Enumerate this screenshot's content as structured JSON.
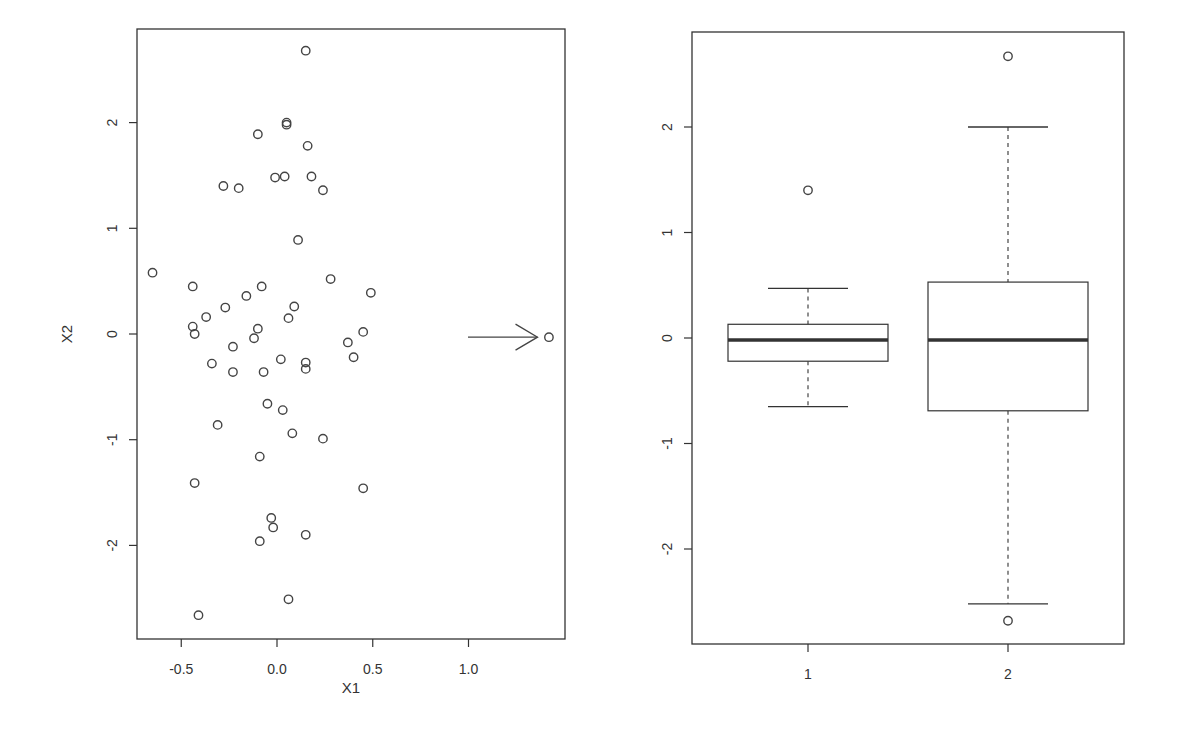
{
  "chart_data": [
    {
      "type": "scatter",
      "title": "",
      "xlabel": "X1",
      "ylabel": "X2",
      "xlim": [
        -0.72,
        1.51
      ],
      "ylim": [
        -2.87,
        2.92
      ],
      "xticks": [
        -0.5,
        0.0,
        0.5,
        1.0
      ],
      "xtick_labels": [
        "-0.5",
        "0.0",
        "0.5",
        "1.0"
      ],
      "yticks": [
        -2,
        -1,
        0,
        1,
        2
      ],
      "ytick_labels": [
        "-2",
        "-1",
        "0",
        "1",
        "2"
      ],
      "grid": false,
      "annotation": {
        "type": "arrow",
        "from": [
          1.0,
          -0.03
        ],
        "to": [
          1.35,
          -0.03
        ],
        "label": "points to outlier"
      },
      "points": [
        {
          "x": 0.15,
          "y": 2.68
        },
        {
          "x": 0.05,
          "y": 2.0
        },
        {
          "x": 0.05,
          "y": 1.98
        },
        {
          "x": -0.1,
          "y": 1.89
        },
        {
          "x": 0.16,
          "y": 1.78
        },
        {
          "x": -0.01,
          "y": 1.48
        },
        {
          "x": 0.04,
          "y": 1.49
        },
        {
          "x": 0.18,
          "y": 1.49
        },
        {
          "x": 0.24,
          "y": 1.36
        },
        {
          "x": -0.28,
          "y": 1.4
        },
        {
          "x": -0.2,
          "y": 1.38
        },
        {
          "x": 0.11,
          "y": 0.89
        },
        {
          "x": -0.65,
          "y": 0.58
        },
        {
          "x": -0.44,
          "y": 0.45
        },
        {
          "x": -0.16,
          "y": 0.36
        },
        {
          "x": -0.08,
          "y": 0.45
        },
        {
          "x": 0.28,
          "y": 0.52
        },
        {
          "x": 0.49,
          "y": 0.39
        },
        {
          "x": -0.37,
          "y": 0.16
        },
        {
          "x": -0.27,
          "y": 0.25
        },
        {
          "x": 0.09,
          "y": 0.26
        },
        {
          "x": 0.06,
          "y": 0.15
        },
        {
          "x": -0.44,
          "y": 0.07
        },
        {
          "x": -0.43,
          "y": 0.0
        },
        {
          "x": -0.1,
          "y": 0.05
        },
        {
          "x": -0.12,
          "y": -0.04
        },
        {
          "x": 0.37,
          "y": -0.08
        },
        {
          "x": 0.45,
          "y": 0.02
        },
        {
          "x": 0.4,
          "y": -0.22
        },
        {
          "x": -0.23,
          "y": -0.12
        },
        {
          "x": -0.34,
          "y": -0.28
        },
        {
          "x": -0.23,
          "y": -0.36
        },
        {
          "x": -0.07,
          "y": -0.36
        },
        {
          "x": 0.02,
          "y": -0.24
        },
        {
          "x": 0.15,
          "y": -0.27
        },
        {
          "x": 0.15,
          "y": -0.33
        },
        {
          "x": -0.05,
          "y": -0.66
        },
        {
          "x": 0.03,
          "y": -0.72
        },
        {
          "x": -0.31,
          "y": -0.86
        },
        {
          "x": 0.08,
          "y": -0.94
        },
        {
          "x": 0.24,
          "y": -0.99
        },
        {
          "x": -0.09,
          "y": -1.16
        },
        {
          "x": -0.43,
          "y": -1.41
        },
        {
          "x": 0.45,
          "y": -1.46
        },
        {
          "x": -0.03,
          "y": -1.74
        },
        {
          "x": -0.02,
          "y": -1.83
        },
        {
          "x": 0.15,
          "y": -1.9
        },
        {
          "x": -0.09,
          "y": -1.96
        },
        {
          "x": 0.06,
          "y": -2.51
        },
        {
          "x": -0.41,
          "y": -2.66
        },
        {
          "x": 1.42,
          "y": -0.03
        }
      ]
    },
    {
      "type": "box",
      "title": "",
      "xlabel": "",
      "ylabel": "",
      "categories": [
        "1",
        "2"
      ],
      "ylim": [
        -2.87,
        2.92
      ],
      "yticks": [
        -2,
        -1,
        0,
        1,
        2
      ],
      "ytick_labels": [
        "-2",
        "-1",
        "0",
        "1",
        "2"
      ],
      "grid": false,
      "boxes": [
        {
          "name": "1",
          "whisker_low": -0.65,
          "q1": -0.22,
          "median": -0.02,
          "q3": 0.13,
          "whisker_high": 0.47,
          "outliers": [
            1.4
          ]
        },
        {
          "name": "2",
          "whisker_low": -2.52,
          "q1": -0.69,
          "median": -0.02,
          "q3": 0.53,
          "whisker_high": 2.0,
          "outliers": [
            2.67,
            -2.68
          ]
        }
      ]
    }
  ],
  "layout": {
    "scatter": {
      "left": 137,
      "top": 29,
      "right": 565,
      "bottom": 639,
      "x0px": 277,
      "xscale": 191.5,
      "y0px": 334,
      "yscale": 105.7
    },
    "boxplot": {
      "left": 692,
      "top": 32,
      "right": 1124,
      "bottom": 644,
      "y0px": 338,
      "yscale": 105.5,
      "centers": [
        808,
        1008
      ],
      "halfwidth": 80,
      "caphalf": 40
    }
  },
  "labels": {
    "scatter_xlabel": "X1",
    "scatter_ylabel": "X2",
    "box_cat_1": "1",
    "box_cat_2": "2"
  },
  "colors": {
    "ink": "#333333",
    "point": "#444444",
    "background": "#ffffff"
  }
}
